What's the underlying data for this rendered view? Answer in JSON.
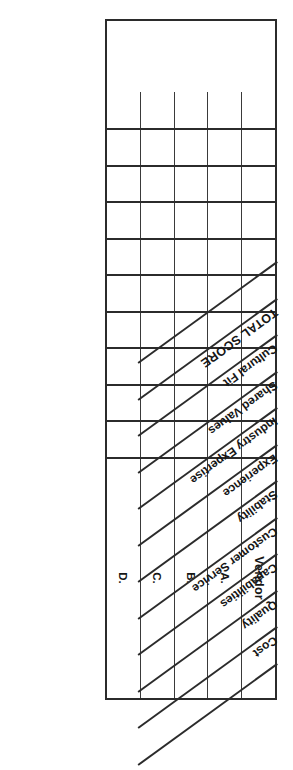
{
  "document": {
    "type": "vendor-evaluation-scorecard",
    "orientation": "rotated-180",
    "row_header_label": "Vendor",
    "total_label": "TOTAL SCORE",
    "criteria": [
      "Cost",
      "Quality",
      "Capabilities",
      "Customer Service",
      "Stability",
      "Experience",
      "Industry Expertise",
      "Shared Values",
      "Cultural Fit"
    ],
    "rows": [
      {
        "label": "A."
      },
      {
        "label": "B."
      },
      {
        "label": "C."
      },
      {
        "label": "D."
      }
    ],
    "cells": [
      [
        "",
        "",
        "",
        "",
        "",
        "",
        "",
        "",
        "",
        ""
      ],
      [
        "",
        "",
        "",
        "",
        "",
        "",
        "",
        "",
        "",
        ""
      ],
      [
        "",
        "",
        "",
        "",
        "",
        "",
        "",
        "",
        "",
        ""
      ],
      [
        "",
        "",
        "",
        "",
        "",
        "",
        "",
        "",
        "",
        ""
      ]
    ],
    "colors": {
      "ink": "#2b2b2b",
      "paper": "#ffffff",
      "grid_line": "#3a3a3a"
    }
  }
}
